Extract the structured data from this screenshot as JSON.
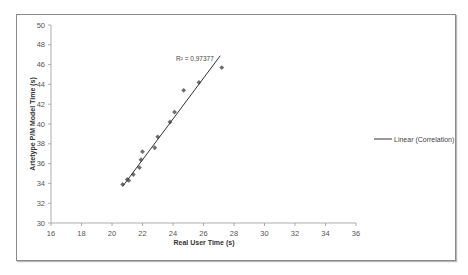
{
  "chart_data": {
    "type": "scatter",
    "title": "",
    "xlabel": "Real User Time (s)",
    "ylabel": "Artetype P/M Model Time (s)",
    "xlim": [
      16,
      36
    ],
    "ylim": [
      30,
      50
    ],
    "x_ticks": [
      16,
      18,
      20,
      22,
      24,
      26,
      28,
      30,
      32,
      34,
      36
    ],
    "y_ticks": [
      30,
      32,
      34,
      36,
      38,
      40,
      42,
      44,
      46,
      48,
      50
    ],
    "grid": false,
    "legend_position": "right",
    "series": [
      {
        "name": "Observations",
        "marker": "diamond",
        "color": "#6e6e6e",
        "points": [
          [
            20.7,
            33.9
          ],
          [
            21.0,
            34.4
          ],
          [
            21.1,
            34.3
          ],
          [
            21.4,
            34.9
          ],
          [
            21.8,
            35.6
          ],
          [
            21.9,
            36.4
          ],
          [
            22.0,
            37.2
          ],
          [
            22.8,
            37.6
          ],
          [
            23.0,
            38.7
          ],
          [
            23.8,
            40.2
          ],
          [
            24.1,
            41.2
          ],
          [
            24.7,
            43.4
          ],
          [
            25.7,
            44.2
          ],
          [
            27.2,
            45.7
          ]
        ]
      },
      {
        "name": "Linear (Correlation)",
        "type": "line",
        "color": "#333333",
        "points": [
          [
            20.7,
            33.7
          ],
          [
            27.1,
            46.9
          ]
        ]
      }
    ],
    "annotations": [
      {
        "text": "R² = 0,97377",
        "x": 24.4,
        "y": 46.5
      }
    ]
  },
  "legend": {
    "items": [
      {
        "label": "Linear (Correlation)"
      }
    ]
  },
  "annotation": {
    "r_squared": "R² = 0,97377"
  },
  "axes": {
    "x_title": "Real User Time (s)",
    "y_title": "Artetype P/M Model Time (s)"
  }
}
